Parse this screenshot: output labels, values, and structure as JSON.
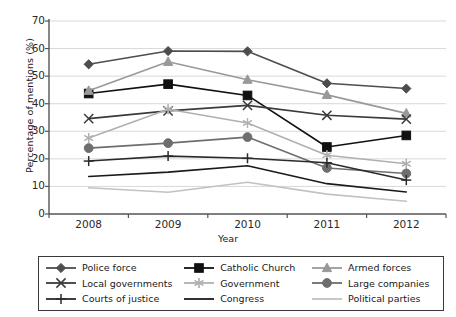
{
  "chart_data": {
    "type": "line",
    "title": "",
    "xlabel": "Year",
    "ylabel": "Percentage of mentions (%)",
    "categories": [
      "2008",
      "2009",
      "2010",
      "2011",
      "2012"
    ],
    "x": [
      2008,
      2009,
      2010,
      2011,
      2012
    ],
    "ylim": [
      0,
      70
    ],
    "ytick_values": [
      0,
      10,
      20,
      30,
      40,
      50,
      60,
      70
    ],
    "ytick_labels": [
      "0",
      "10",
      "20",
      "30",
      "40",
      "50",
      "60",
      "70"
    ],
    "grid": "horizontal",
    "legend_position": "bottom",
    "legend_columns": 3,
    "series": [
      {
        "name": "Police force",
        "marker": "diamond",
        "color": "#4d4d4d",
        "line_color": "#4d4d4d",
        "values": [
          54.3,
          59.1,
          59.0,
          47.4,
          45.5
        ]
      },
      {
        "name": "Catholic Church",
        "marker": "square",
        "color": "#111111",
        "line_color": "#111111",
        "values": [
          43.7,
          47.1,
          43.0,
          24.3,
          28.5
        ]
      },
      {
        "name": "Armed forces",
        "marker": "triangle",
        "color": "#999999",
        "line_color": "#999999",
        "values": [
          44.7,
          55.2,
          48.7,
          43.2,
          36.5
        ]
      },
      {
        "name": "Local governments",
        "marker": "x",
        "color": "#3a3a3a",
        "line_color": "#3a3a3a",
        "values": [
          34.6,
          37.4,
          39.4,
          35.8,
          34.4
        ]
      },
      {
        "name": "Government",
        "marker": "asterisk",
        "color": "#b0b0b0",
        "line_color": "#b0b0b0",
        "values": [
          27.6,
          38.0,
          33.0,
          21.3,
          18.2
        ]
      },
      {
        "name": "Large companies",
        "marker": "circle",
        "color": "#6e6e6e",
        "line_color": "#6e6e6e",
        "values": [
          23.9,
          25.7,
          27.9,
          16.7,
          14.7
        ]
      },
      {
        "name": "Courts of justice",
        "marker": "plus",
        "color": "#2b2b2b",
        "line_color": "#2b2b2b",
        "values": [
          19.2,
          21.0,
          20.2,
          18.6,
          12.3
        ]
      },
      {
        "name": "Congress",
        "marker": "none",
        "color": "#1a1a1a",
        "line_color": "#1a1a1a",
        "values": [
          13.6,
          15.2,
          17.5,
          11.0,
          8.0
        ]
      },
      {
        "name": "Political parties",
        "marker": "none",
        "color": "#c2c2c2",
        "line_color": "#c2c2c2",
        "values": [
          9.5,
          7.9,
          11.5,
          7.2,
          4.6
        ]
      }
    ]
  },
  "axes": {
    "y_title": "Percentage of mentions (%)",
    "x_title": "Year"
  }
}
